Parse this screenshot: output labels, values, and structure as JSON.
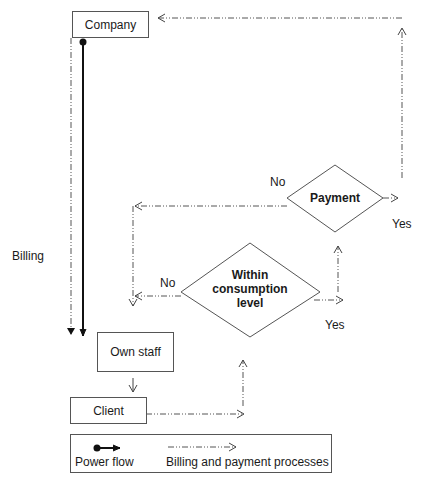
{
  "nodes": {
    "company": "Company",
    "own_staff": "Own staff",
    "client": "Client"
  },
  "decisions": {
    "payment": "Payment",
    "consumption_line1": "Within",
    "consumption_line2": "consumption",
    "consumption_line3": "level"
  },
  "edge_labels": {
    "billing": "Billing",
    "payment_no": "No",
    "payment_yes": "Yes",
    "consumption_no": "No",
    "consumption_yes": "Yes"
  },
  "legend": {
    "power_flow": "Power flow",
    "billing_payment": "Billing and payment processes"
  },
  "colors": {
    "line": "#333333",
    "dashed": "#555555"
  }
}
